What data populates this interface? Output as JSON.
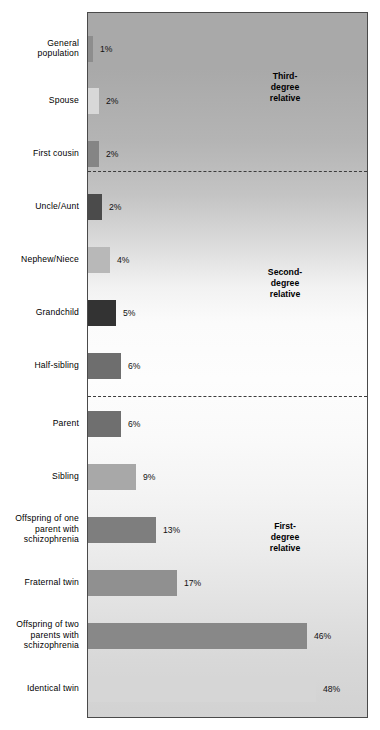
{
  "chart_data": {
    "type": "bar",
    "orientation": "horizontal",
    "title": "",
    "xlabel": "",
    "ylabel": "",
    "xlim": [
      0,
      50
    ],
    "grid": false,
    "legend": "none",
    "value_suffix": "%",
    "categories": [
      "General population",
      "Spouse",
      "First cousin",
      "Uncle/Aunt",
      "Nephew/Niece",
      "Grandchild",
      "Half-sibling",
      "Parent",
      "Sibling",
      "Offspring of one parent with schizophrenia",
      "Fraternal twin",
      "Offspring of two parents with schizophrenia",
      "Identical twin"
    ],
    "values": [
      1,
      2,
      2,
      2,
      4,
      5,
      6,
      6,
      9,
      13,
      17,
      46,
      48
    ],
    "value_labels": [
      "1%",
      "2%",
      "2%",
      "2%",
      "4%",
      "5%",
      "6%",
      "6%",
      "9%",
      "13%",
      "17%",
      "46%",
      "48%"
    ],
    "bars": [
      {
        "label": "General population",
        "label_lines": [
          "General",
          "population"
        ],
        "value": 1,
        "value_label": "1%",
        "color": "#8d8d8d",
        "top": 23,
        "width": 5
      },
      {
        "label": "Spouse",
        "label_lines": [
          "Spouse"
        ],
        "value": 2,
        "value_label": "2%",
        "color": "#d8d8d8",
        "top": 75,
        "width": 11
      },
      {
        "label": "First cousin",
        "label_lines": [
          "First cousin"
        ],
        "value": 2,
        "value_label": "2%",
        "color": "#858585",
        "top": 128,
        "width": 11
      },
      {
        "label": "Uncle/Aunt",
        "label_lines": [
          "Uncle/Aunt"
        ],
        "value": 2,
        "value_label": "2%",
        "color": "#4b4b4b",
        "top": 181,
        "width": 14
      },
      {
        "label": "Nephew/Niece",
        "label_lines": [
          "Nephew/Niece"
        ],
        "value": 4,
        "value_label": "4%",
        "color": "#b8b8b8",
        "top": 234,
        "width": 22
      },
      {
        "label": "Grandchild",
        "label_lines": [
          "Grandchild"
        ],
        "value": 5,
        "value_label": "5%",
        "color": "#333333",
        "top": 287,
        "width": 28
      },
      {
        "label": "Half-sibling",
        "label_lines": [
          "Half-sibling"
        ],
        "value": 6,
        "value_label": "6%",
        "color": "#6e6e6e",
        "top": 340,
        "width": 33
      },
      {
        "label": "Parent",
        "label_lines": [
          "Parent"
        ],
        "value": 6,
        "value_label": "6%",
        "color": "#6f6f6f",
        "top": 398,
        "width": 33
      },
      {
        "label": "Sibling",
        "label_lines": [
          "Sibling"
        ],
        "value": 9,
        "value_label": "9%",
        "color": "#a8a8a8",
        "top": 451,
        "width": 48
      },
      {
        "label": "Offspring of one parent with schizophrenia",
        "label_lines": [
          "Offspring of one",
          "parent with",
          "schizophrenia"
        ],
        "value": 13,
        "value_label": "13%",
        "color": "#7e7e7e",
        "top": 504,
        "width": 68
      },
      {
        "label": "Fraternal twin",
        "label_lines": [
          "Fraternal twin"
        ],
        "value": 17,
        "value_label": "17%",
        "color": "#909090",
        "top": 557,
        "width": 89
      },
      {
        "label": "Offspring of two parents with schizophrenia",
        "label_lines": [
          "Offspring of two",
          "parents with",
          "schizophrenia"
        ],
        "value": 46,
        "value_label": "46%",
        "color": "#888888",
        "top": 610,
        "width": 219
      },
      {
        "label": "Identical twin",
        "label_lines": [
          "Identical twin"
        ],
        "value": 48,
        "value_label": "48%",
        "color": "#d6d6d6",
        "top": 663,
        "width": 228
      }
    ],
    "groups": [
      {
        "name": "third-degree",
        "lines": [
          "Third-",
          "degree",
          "relative"
        ],
        "top": 58
      },
      {
        "name": "second-degree",
        "lines": [
          "Second-",
          "degree",
          "relative"
        ],
        "top": 254
      },
      {
        "name": "first-degree",
        "lines": [
          "First-",
          "degree",
          "relative"
        ],
        "top": 508
      }
    ],
    "dividers": [
      {
        "name": "third-to-second-divider",
        "top": 158
      },
      {
        "name": "second-to-first-divider",
        "top": 383
      }
    ],
    "colors": {
      "frame_border": "#4a4a4a",
      "divider": "#3c3c3c",
      "text": "#000000",
      "background_top": "#a9a9a9",
      "background_mid": "#fdfdfd",
      "background_bottom": "#d2d2d2"
    }
  }
}
